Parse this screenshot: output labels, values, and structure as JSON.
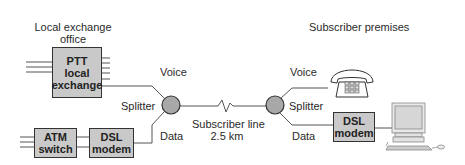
{
  "diagram": {
    "left_site": {
      "title_line1": "Local exchange",
      "title_line2": "office"
    },
    "right_site": {
      "title": "Subscriber premises"
    },
    "ptt_box": {
      "line1": "PTT",
      "line2": "local",
      "line3": "exchange"
    },
    "atm_box": {
      "line1": "ATM",
      "line2": "switch"
    },
    "dsl_left": {
      "line1": "DSL",
      "line2": "modem"
    },
    "dsl_right": {
      "line1": "DSL",
      "line2": "modem"
    },
    "left_splitter": {
      "label": "Splitter",
      "voice": "Voice",
      "data": "Data"
    },
    "right_splitter": {
      "label": "Splitter",
      "voice": "Voice",
      "data": "Data"
    },
    "line": {
      "label_line1": "Subscriber line",
      "label_line2": "2.5 km"
    },
    "devices": {
      "phone": "telephone-icon",
      "computer": "computer-icon"
    },
    "colors": {
      "box_fill": "#c9c9c9",
      "splitter_fill": "#a8a8a8",
      "line": "#555555"
    }
  }
}
